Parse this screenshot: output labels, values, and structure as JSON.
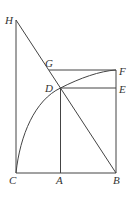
{
  "diagram": {
    "points": {
      "H": {
        "label": "H",
        "x": 16,
        "y": 20
      },
      "G": {
        "label": "G",
        "x": 49,
        "y": 70
      },
      "F": {
        "label": "F",
        "x": 116,
        "y": 70
      },
      "D": {
        "label": "D",
        "x": 60.5,
        "y": 88
      },
      "E": {
        "label": "E",
        "x": 116,
        "y": 88
      },
      "C": {
        "label": "C",
        "x": 16,
        "y": 173
      },
      "A": {
        "label": "A",
        "x": 60.5,
        "y": 173
      },
      "B": {
        "label": "B",
        "x": 116,
        "y": 173
      }
    },
    "segments": [
      "HC",
      "HB",
      "CB",
      "BF",
      "GF",
      "DE",
      "DA"
    ],
    "arcs": [
      "C-D-F curve"
    ],
    "colors": {
      "stroke": "#444444",
      "label": "#333333",
      "background": "#ffffff"
    }
  }
}
